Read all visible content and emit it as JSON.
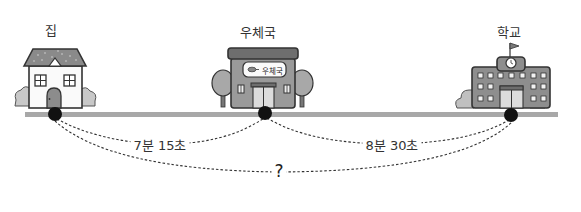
{
  "places": [
    {
      "id": "home",
      "label": "집",
      "x": 55
    },
    {
      "id": "post_office",
      "label": "우체국",
      "x": 265,
      "sign_text": "우체국"
    },
    {
      "id": "school",
      "label": "학교",
      "x": 511
    }
  ],
  "segments": [
    {
      "from": "home",
      "to": "post_office",
      "label": "7분 15초"
    },
    {
      "from": "post_office",
      "to": "school",
      "label": "8분 30초"
    },
    {
      "from": "home",
      "to": "school",
      "label": "?"
    }
  ],
  "colors": {
    "road": "#a8a8a8",
    "dot": "#111111",
    "building_gray": "#8c8c8c",
    "roof_gray": "#7a7a7a",
    "bush_gray": "#c8c8c8",
    "outline": "#333333"
  }
}
